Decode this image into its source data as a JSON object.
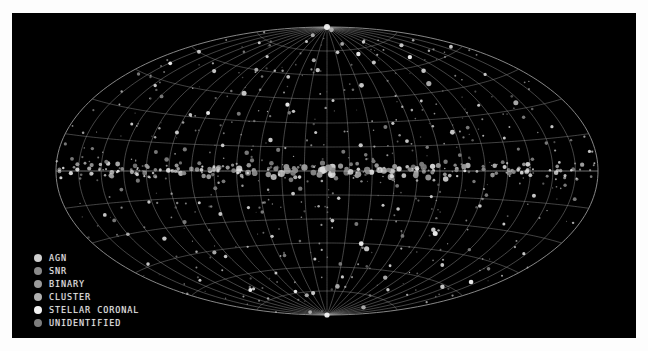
{
  "figure": {
    "background_color": "#000000",
    "frame_color": "#ffffff",
    "title": ""
  },
  "legend": {
    "position": "lower-left",
    "items": [
      {
        "label": "AGN",
        "color": "#cfcfcf",
        "marker": "filled-circle"
      },
      {
        "label": "SNR",
        "color": "#8a8a8a",
        "marker": "filled-circle"
      },
      {
        "label": "BINARY",
        "color": "#9a9a9a",
        "marker": "filled-circle"
      },
      {
        "label": "CLUSTER",
        "color": "#b0b0b0",
        "marker": "filled-circle"
      },
      {
        "label": "STELLAR CORONAL",
        "color": "#f2f2f2",
        "marker": "filled-circle"
      },
      {
        "label": "UNIDENTIFIED",
        "color": "#7d7d7d",
        "marker": "filled-circle"
      }
    ]
  },
  "chart_data": {
    "type": "scatter",
    "title": "",
    "subtitle": "",
    "projection": "aitoff",
    "coordinate_system": "galactic",
    "xlabel": "Galactic longitude l",
    "ylabel": "Galactic latitude b",
    "xlim": [
      180,
      -180
    ],
    "ylim": [
      -90,
      90
    ],
    "grid": true,
    "grid_color": "#9e9e9e",
    "grid_meridian_step_deg": 15,
    "grid_parallel_step_deg": 15,
    "grid_labeled_meridians_deg": [
      -150,
      -120,
      -90,
      -60,
      -30,
      0,
      30,
      60,
      90,
      120,
      150
    ],
    "grid_labeled_parallels_deg": [
      -75,
      -60,
      -45,
      -30,
      -15,
      0,
      15,
      30,
      45,
      60,
      75
    ],
    "legend_position": "lower left",
    "marker_size_meaning": "source brightness / flux",
    "series": [
      {
        "name": "AGN",
        "color": "#cfcfcf",
        "count": 66,
        "points": [
          {
            "l": 171,
            "b": 62,
            "r": 1.9
          },
          {
            "l": 150,
            "b": 48,
            "r": 1.6
          },
          {
            "l": 132,
            "b": 71,
            "r": 2.1
          },
          {
            "l": 118,
            "b": 35,
            "r": 1.5
          },
          {
            "l": 104,
            "b": 57,
            "r": 2.3
          },
          {
            "l": 90,
            "b": 78,
            "r": 1.7
          },
          {
            "l": 77,
            "b": 41,
            "r": 1.4
          },
          {
            "l": 62,
            "b": 66,
            "r": 2.0
          },
          {
            "l": 48,
            "b": 29,
            "r": 1.6
          },
          {
            "l": 33,
            "b": 53,
            "r": 2.4
          },
          {
            "l": 19,
            "b": 74,
            "r": 1.8
          },
          {
            "l": 5,
            "b": 44,
            "r": 1.5
          },
          {
            "l": -11,
            "b": 63,
            "r": 2.2
          },
          {
            "l": -26,
            "b": 37,
            "r": 1.7
          },
          {
            "l": -41,
            "b": 58,
            "r": 1.9
          },
          {
            "l": -57,
            "b": 80,
            "r": 1.5
          },
          {
            "l": -72,
            "b": 46,
            "r": 2.5
          },
          {
            "l": -87,
            "b": 68,
            "r": 1.6
          },
          {
            "l": -102,
            "b": 31,
            "r": 1.8
          },
          {
            "l": -118,
            "b": 55,
            "r": 2.1
          },
          {
            "l": -133,
            "b": 73,
            "r": 1.5
          },
          {
            "l": -148,
            "b": 42,
            "r": 1.7
          },
          {
            "l": -163,
            "b": 60,
            "r": 2.0
          },
          {
            "l": 163,
            "b": -38,
            "r": 1.6
          },
          {
            "l": 146,
            "b": -61,
            "r": 2.2
          },
          {
            "l": 129,
            "b": -27,
            "r": 1.5
          },
          {
            "l": 113,
            "b": -52,
            "r": 1.9
          },
          {
            "l": 97,
            "b": -70,
            "r": 1.7
          },
          {
            "l": 81,
            "b": -34,
            "r": 2.3
          },
          {
            "l": 66,
            "b": -57,
            "r": 1.4
          },
          {
            "l": 50,
            "b": -23,
            "r": 1.8
          },
          {
            "l": 35,
            "b": -48,
            "r": 2.6
          },
          {
            "l": 20,
            "b": -66,
            "r": 1.6
          },
          {
            "l": 4,
            "b": -31,
            "r": 1.9
          },
          {
            "l": -12,
            "b": -55,
            "r": 1.5
          },
          {
            "l": -28,
            "b": -76,
            "r": 2.1
          },
          {
            "l": -44,
            "b": -40,
            "r": 1.7
          },
          {
            "l": -60,
            "b": -62,
            "r": 1.5
          },
          {
            "l": -76,
            "b": -25,
            "r": 2.0
          },
          {
            "l": -93,
            "b": -49,
            "r": 1.8
          },
          {
            "l": -110,
            "b": -68,
            "r": 1.6
          },
          {
            "l": -127,
            "b": -35,
            "r": 2.2
          },
          {
            "l": -144,
            "b": -57,
            "r": 1.5
          },
          {
            "l": -161,
            "b": -44,
            "r": 1.8
          },
          {
            "l": 158,
            "b": 20,
            "r": 1.6
          },
          {
            "l": 140,
            "b": -12,
            "r": 2.0
          },
          {
            "l": 122,
            "b": 17,
            "r": 1.5
          },
          {
            "l": 106,
            "b": -19,
            "r": 1.8
          },
          {
            "l": 88,
            "b": 22,
            "r": 2.4
          },
          {
            "l": 71,
            "b": -15,
            "r": 1.6
          },
          {
            "l": 55,
            "b": 18,
            "r": 1.9
          },
          {
            "l": 39,
            "b": -21,
            "r": 1.5
          },
          {
            "l": 23,
            "b": 16,
            "r": 2.1
          },
          {
            "l": 8,
            "b": -17,
            "r": 1.7
          },
          {
            "l": -8,
            "b": 24,
            "r": 1.5
          },
          {
            "l": -23,
            "b": -14,
            "r": 1.9
          },
          {
            "l": -39,
            "b": 19,
            "r": 2.2
          },
          {
            "l": -55,
            "b": -22,
            "r": 1.6
          },
          {
            "l": -71,
            "b": 15,
            "r": 1.8
          },
          {
            "l": -88,
            "b": -18,
            "r": 1.5
          },
          {
            "l": -105,
            "b": 21,
            "r": 2.0
          },
          {
            "l": -122,
            "b": -16,
            "r": 1.7
          },
          {
            "l": -139,
            "b": 23,
            "r": 1.5
          },
          {
            "l": -156,
            "b": -20,
            "r": 1.9
          },
          {
            "l": 176,
            "b": 8,
            "r": 1.6
          }
        ]
      },
      {
        "name": "SNR",
        "color": "#8a8a8a",
        "count": 18,
        "points": [
          {
            "l": 4,
            "b": 0.5,
            "r": 2.6
          },
          {
            "l": -9,
            "b": -1.0,
            "r": 2.9
          },
          {
            "l": 13,
            "b": 1.2,
            "r": 2.4
          },
          {
            "l": -21,
            "b": 0.3,
            "r": 2.7
          },
          {
            "l": 27,
            "b": -0.8,
            "r": 2.2
          },
          {
            "l": -34,
            "b": 1.4,
            "r": 2.5
          },
          {
            "l": 41,
            "b": 0.6,
            "r": 2.3
          },
          {
            "l": -48,
            "b": -1.3,
            "r": 2.8
          },
          {
            "l": 55,
            "b": 1.0,
            "r": 2.1
          },
          {
            "l": -62,
            "b": 0.2,
            "r": 2.4
          },
          {
            "l": 70,
            "b": -0.9,
            "r": 2.0
          },
          {
            "l": -78,
            "b": 1.1,
            "r": 2.3
          },
          {
            "l": 86,
            "b": 0.4,
            "r": 1.9
          },
          {
            "l": -95,
            "b": -1.2,
            "r": 2.2
          },
          {
            "l": 104,
            "b": 0.9,
            "r": 2.0
          },
          {
            "l": -114,
            "b": 0.6,
            "r": 1.8
          },
          {
            "l": 124,
            "b": -0.5,
            "r": 2.1
          },
          {
            "l": -136,
            "b": 1.0,
            "r": 1.9
          }
        ]
      },
      {
        "name": "BINARY",
        "color": "#9a9a9a",
        "count": 22,
        "points": [
          {
            "l": 1,
            "b": 2.0,
            "r": 3.4
          },
          {
            "l": -5,
            "b": -2.4,
            "r": 3.0
          },
          {
            "l": 9,
            "b": 3.1,
            "r": 2.6
          },
          {
            "l": -15,
            "b": 2.2,
            "r": 3.2
          },
          {
            "l": 20,
            "b": -3.0,
            "r": 2.4
          },
          {
            "l": -27,
            "b": 2.6,
            "r": 2.9
          },
          {
            "l": 33,
            "b": 3.4,
            "r": 2.2
          },
          {
            "l": -39,
            "b": -2.1,
            "r": 2.7
          },
          {
            "l": 45,
            "b": 2.8,
            "r": 2.5
          },
          {
            "l": -52,
            "b": 3.5,
            "r": 2.3
          },
          {
            "l": 59,
            "b": -2.6,
            "r": 2.8
          },
          {
            "l": -66,
            "b": 2.0,
            "r": 2.1
          },
          {
            "l": 74,
            "b": 3.2,
            "r": 2.5
          },
          {
            "l": -82,
            "b": -2.9,
            "r": 2.2
          },
          {
            "l": 91,
            "b": 2.4,
            "r": 2.6
          },
          {
            "l": -100,
            "b": 3.0,
            "r": 2.0
          },
          {
            "l": 110,
            "b": -2.2,
            "r": 2.3
          },
          {
            "l": -120,
            "b": 2.7,
            "r": 2.1
          },
          {
            "l": 131,
            "b": 3.3,
            "r": 1.9
          },
          {
            "l": -143,
            "b": -2.5,
            "r": 2.2
          },
          {
            "l": 153,
            "b": 2.1,
            "r": 1.8
          },
          {
            "l": -166,
            "b": 2.9,
            "r": 2.0
          }
        ]
      },
      {
        "name": "CLUSTER",
        "color": "#b0b0b0",
        "count": 14,
        "points": [
          {
            "l": 57,
            "b": 88,
            "r": 2.4
          },
          {
            "l": -64,
            "b": 84,
            "r": 2.0
          },
          {
            "l": 128,
            "b": -81,
            "r": 2.2
          },
          {
            "l": -131,
            "b": -86,
            "r": 1.9
          },
          {
            "l": 95,
            "b": 50,
            "r": 2.6
          },
          {
            "l": -99,
            "b": -46,
            "r": 2.1
          },
          {
            "l": 17,
            "b": -72,
            "r": 2.3
          },
          {
            "l": -19,
            "b": 69,
            "r": 2.0
          },
          {
            "l": 146,
            "b": 33,
            "r": 2.5
          },
          {
            "l": -150,
            "b": -30,
            "r": 1.8
          },
          {
            "l": 73,
            "b": -64,
            "r": 2.2
          },
          {
            "l": -80,
            "b": 60,
            "r": 2.0
          },
          {
            "l": 38,
            "b": 79,
            "r": 1.9
          },
          {
            "l": -44,
            "b": -77,
            "r": 2.1
          }
        ]
      },
      {
        "name": "STELLAR CORONAL",
        "color": "#f2f2f2",
        "count": 12,
        "points": [
          {
            "l": 0,
            "b": 90,
            "r": 3.0
          },
          {
            "l": 0,
            "b": -90,
            "r": 2.6
          },
          {
            "l": 112,
            "b": 65,
            "r": 2.2
          },
          {
            "l": -116,
            "b": -68,
            "r": 2.0
          },
          {
            "l": 29,
            "b": -45,
            "r": 2.4
          },
          {
            "l": -32,
            "b": 41,
            "r": 2.1
          },
          {
            "l": 160,
            "b": -55,
            "r": 2.3
          },
          {
            "l": -164,
            "b": 52,
            "r": 1.9
          },
          {
            "l": 84,
            "b": -36,
            "r": 2.5
          },
          {
            "l": -90,
            "b": 33,
            "r": 2.0
          },
          {
            "l": 52,
            "b": 72,
            "r": 2.2
          },
          {
            "l": -58,
            "b": -74,
            "r": 1.8
          }
        ]
      },
      {
        "name": "UNIDENTIFIED",
        "color": "#7d7d7d",
        "count": 54,
        "points": [
          {
            "l": 6,
            "b": -4.5,
            "r": 2.2
          },
          {
            "l": -3,
            "b": 5.0,
            "r": 2.6
          },
          {
            "l": 16,
            "b": 4.2,
            "r": 1.9
          },
          {
            "l": -24,
            "b": -5.5,
            "r": 2.4
          },
          {
            "l": 31,
            "b": 6.0,
            "r": 2.0
          },
          {
            "l": -37,
            "b": 4.8,
            "r": 2.3
          },
          {
            "l": 44,
            "b": -5.2,
            "r": 1.8
          },
          {
            "l": -50,
            "b": 6.4,
            "r": 2.1
          },
          {
            "l": 63,
            "b": 4.0,
            "r": 2.5
          },
          {
            "l": -69,
            "b": -6.1,
            "r": 1.9
          },
          {
            "l": 79,
            "b": 5.3,
            "r": 2.2
          },
          {
            "l": -85,
            "b": 4.4,
            "r": 2.0
          },
          {
            "l": 98,
            "b": -5.8,
            "r": 1.7
          },
          {
            "l": -107,
            "b": 6.2,
            "r": 2.3
          },
          {
            "l": 117,
            "b": 4.6,
            "r": 1.9
          },
          {
            "l": -126,
            "b": -4.9,
            "r": 2.1
          },
          {
            "l": 137,
            "b": 5.7,
            "r": 1.8
          },
          {
            "l": -147,
            "b": 4.3,
            "r": 2.0
          },
          {
            "l": 159,
            "b": -6.3,
            "r": 1.7
          },
          {
            "l": -170,
            "b": 5.1,
            "r": 1.9
          },
          {
            "l": 11,
            "b": 12,
            "r": 2.0
          },
          {
            "l": -18,
            "b": -11,
            "r": 2.2
          },
          {
            "l": 26,
            "b": 10,
            "r": 1.8
          },
          {
            "l": -33,
            "b": 13,
            "r": 2.1
          },
          {
            "l": 47,
            "b": -9,
            "r": 1.9
          },
          {
            "l": -54,
            "b": 11,
            "r": 2.3
          },
          {
            "l": 68,
            "b": 14,
            "r": 1.7
          },
          {
            "l": -75,
            "b": -10,
            "r": 2.0
          },
          {
            "l": 89,
            "b": 9,
            "r": 1.9
          },
          {
            "l": -96,
            "b": 12,
            "r": 2.1
          },
          {
            "l": 108,
            "b": -13,
            "r": 1.8
          },
          {
            "l": -115,
            "b": 10,
            "r": 2.0
          },
          {
            "l": 129,
            "b": 11,
            "r": 1.6
          },
          {
            "l": -138,
            "b": -9,
            "r": 1.9
          },
          {
            "l": 149,
            "b": 13,
            "r": 1.8
          },
          {
            "l": -158,
            "b": 10,
            "r": 1.7
          },
          {
            "l": 168,
            "b": -12,
            "r": 1.9
          },
          {
            "l": -177,
            "b": 11,
            "r": 1.6
          },
          {
            "l": 42,
            "b": 27,
            "r": 2.0
          },
          {
            "l": -46,
            "b": -25,
            "r": 1.8
          },
          {
            "l": 100,
            "b": 24,
            "r": 1.9
          },
          {
            "l": -104,
            "b": -28,
            "r": 2.1
          },
          {
            "l": 143,
            "b": 26,
            "r": 1.7
          },
          {
            "l": -152,
            "b": -23,
            "r": 1.9
          },
          {
            "l": 22,
            "b": -33,
            "r": 2.0
          },
          {
            "l": -29,
            "b": 36,
            "r": 1.8
          },
          {
            "l": 60,
            "b": -39,
            "r": 1.9
          },
          {
            "l": -67,
            "b": 34,
            "r": 2.0
          },
          {
            "l": 120,
            "b": -42,
            "r": 1.7
          },
          {
            "l": -134,
            "b": 38,
            "r": 1.9
          },
          {
            "l": 154,
            "b": -48,
            "r": 1.8
          },
          {
            "l": -172,
            "b": 44,
            "r": 1.7
          },
          {
            "l": 14,
            "b": -58,
            "r": 1.9
          },
          {
            "l": -40,
            "b": -52,
            "r": 1.8
          }
        ]
      }
    ],
    "annotations": [
      {
        "text": "",
        "l": 0,
        "b": 0
      }
    ]
  }
}
